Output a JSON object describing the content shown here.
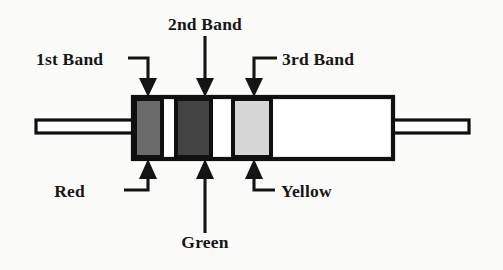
{
  "top_labels": [
    {
      "id": "band1",
      "text": "1st Band",
      "leader": "elbow-right-down"
    },
    {
      "id": "band2",
      "text": "2nd Band",
      "leader": "straight-down"
    },
    {
      "id": "band3",
      "text": "3rd Band",
      "leader": "elbow-left-down"
    }
  ],
  "bottom_labels": [
    {
      "id": "color1",
      "text": "Red",
      "leader": "elbow-right-up"
    },
    {
      "id": "color2",
      "text": "Green",
      "leader": "straight-up"
    },
    {
      "id": "color3",
      "text": "Yellow",
      "leader": "elbow-left-up"
    }
  ],
  "bands": [
    {
      "order": 1,
      "band_label": "1st Band",
      "color_name": "Red",
      "fill": "#6b6b6b"
    },
    {
      "order": 2,
      "band_label": "2nd Band",
      "color_name": "Green",
      "fill": "#434343"
    },
    {
      "order": 3,
      "band_label": "3rd Band",
      "color_name": "Yellow",
      "fill": "#d6d6d6"
    }
  ],
  "colors": {
    "ink": "#141414",
    "page_background": "#fbfbfa",
    "body_fill": "#ffffff",
    "band_red": "#6b6b6b",
    "band_green": "#434343",
    "band_yellow": "#d6d6d6"
  }
}
